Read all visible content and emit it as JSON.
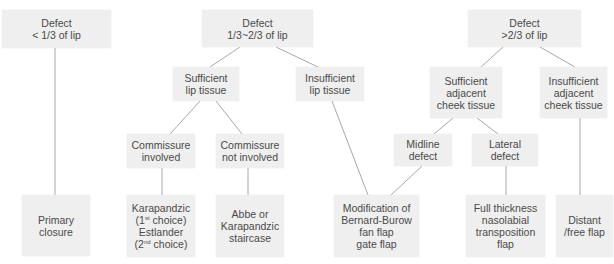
{
  "diagram": {
    "title": "",
    "nodes": [
      {
        "id": "d1",
        "label": "Defect\n< 1/3 of lip",
        "x": 2,
        "y": 10,
        "w": 109,
        "h": 38
      },
      {
        "id": "d2",
        "label": "Defect\n1/3~2/3 of lip",
        "x": 202,
        "y": 10,
        "w": 111,
        "h": 37
      },
      {
        "id": "d3",
        "label": "Defect\n>2/3 of lip",
        "x": 468,
        "y": 10,
        "w": 113,
        "h": 37
      },
      {
        "id": "slt",
        "label": "Sufficient\nlip tissue",
        "x": 173,
        "y": 67,
        "w": 66,
        "h": 34
      },
      {
        "id": "ilt",
        "label": "Insufficient\nlip tissue",
        "x": 296,
        "y": 67,
        "w": 68,
        "h": 34
      },
      {
        "id": "sact",
        "label": "Sufficient\nadjacent\ncheek tissue",
        "x": 430,
        "y": 67,
        "w": 72,
        "h": 51
      },
      {
        "id": "iact",
        "label": "Insufficient\nadjacent\ncheek tissue",
        "x": 540,
        "y": 67,
        "w": 67,
        "h": 51
      },
      {
        "id": "ci",
        "label": "Commissure\ninvolved",
        "x": 127,
        "y": 134,
        "w": 68,
        "h": 34
      },
      {
        "id": "cni",
        "label": "Commissure\nnot involved",
        "x": 216,
        "y": 134,
        "w": 68,
        "h": 34
      },
      {
        "id": "md",
        "label": "Midline\ndefect",
        "x": 394,
        "y": 134,
        "w": 58,
        "h": 32
      },
      {
        "id": "ld",
        "label": "Lateral\ndefect",
        "x": 472,
        "y": 134,
        "w": 66,
        "h": 32
      },
      {
        "id": "pc",
        "label": "Primary\nclosure",
        "x": 22,
        "y": 195,
        "w": 68,
        "h": 61
      },
      {
        "id": "ke",
        "label": "Karapandzic\n(1st choice)\nEstlander\n(2nd choice)",
        "x": 127,
        "y": 195,
        "w": 68,
        "h": 62
      },
      {
        "id": "ak",
        "label": "Abbe or\nKarapandzic\nstaircase",
        "x": 216,
        "y": 195,
        "w": 68,
        "h": 62
      },
      {
        "id": "mbb",
        "label": "Modification of\nBernard-Burow\nfan flap\ngate flap",
        "x": 334,
        "y": 195,
        "w": 85,
        "h": 62
      },
      {
        "id": "ftn",
        "label": "Full thickness\nnasolabial\ntransposition\nflap",
        "x": 466,
        "y": 195,
        "w": 79,
        "h": 62
      },
      {
        "id": "df",
        "label": "Distant\n/free flap",
        "x": 556,
        "y": 195,
        "w": 57,
        "h": 62
      }
    ],
    "edges": [
      {
        "from": "d1",
        "to": "pc"
      },
      {
        "from": "d2",
        "to": "slt"
      },
      {
        "from": "d2",
        "to": "ilt"
      },
      {
        "from": "slt",
        "to": "ci"
      },
      {
        "from": "slt",
        "to": "cni"
      },
      {
        "from": "ci",
        "to": "ke"
      },
      {
        "from": "cni",
        "to": "ak"
      },
      {
        "from": "ilt",
        "to": "mbb"
      },
      {
        "from": "d3",
        "to": "sact"
      },
      {
        "from": "d3",
        "to": "iact"
      },
      {
        "from": "sact",
        "to": "md"
      },
      {
        "from": "sact",
        "to": "ld"
      },
      {
        "from": "md",
        "to": "mbb"
      },
      {
        "from": "ld",
        "to": "ftn"
      },
      {
        "from": "iact",
        "to": "df"
      }
    ],
    "colors": {
      "box_fill": "#efefef",
      "line": "#a8a8a8",
      "text": "#4a4a4a"
    }
  }
}
